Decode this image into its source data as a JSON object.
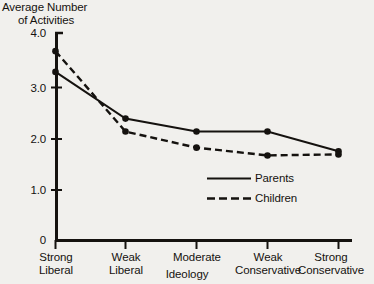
{
  "chart_data": {
    "type": "line",
    "title": "",
    "ylabel": "Average Number of Activities",
    "ylabel_line1": "Average Number",
    "ylabel_line2": "of Activities",
    "xlabel": "Ideology",
    "categories": [
      "Strong Liberal",
      "Weak Liberal",
      "Moderate",
      "Weak Conservative",
      "Strong Conservative"
    ],
    "category_lines": [
      [
        "Strong",
        "Liberal"
      ],
      [
        "Weak",
        "Liberal"
      ],
      [
        "Moderate",
        ""
      ],
      [
        "Weak",
        "Conservative"
      ],
      [
        "Strong",
        "Conservative"
      ]
    ],
    "ylim": [
      0,
      4.0
    ],
    "ytick_labels": [
      "4.0",
      "3.0",
      "2.0",
      "1.0",
      "0"
    ],
    "ytick_values": [
      4.0,
      3.0,
      2.0,
      1.0,
      0
    ],
    "grid": false,
    "legend_position": "inside-lower-right",
    "series": [
      {
        "name": "Parents",
        "style": "solid",
        "values": [
          3.25,
          2.35,
          2.1,
          2.1,
          1.72
        ]
      },
      {
        "name": "Children",
        "style": "dashed",
        "values": [
          3.65,
          2.1,
          1.79,
          1.64,
          1.66
        ]
      }
    ]
  },
  "legend": {
    "items": [
      {
        "label": "Parents",
        "style": "solid"
      },
      {
        "label": "Children",
        "style": "dashed"
      }
    ]
  },
  "colors": {
    "background": "#f1f0ed",
    "ink": "#15120f",
    "series_parents": "#15120f",
    "series_children": "#15120f"
  }
}
